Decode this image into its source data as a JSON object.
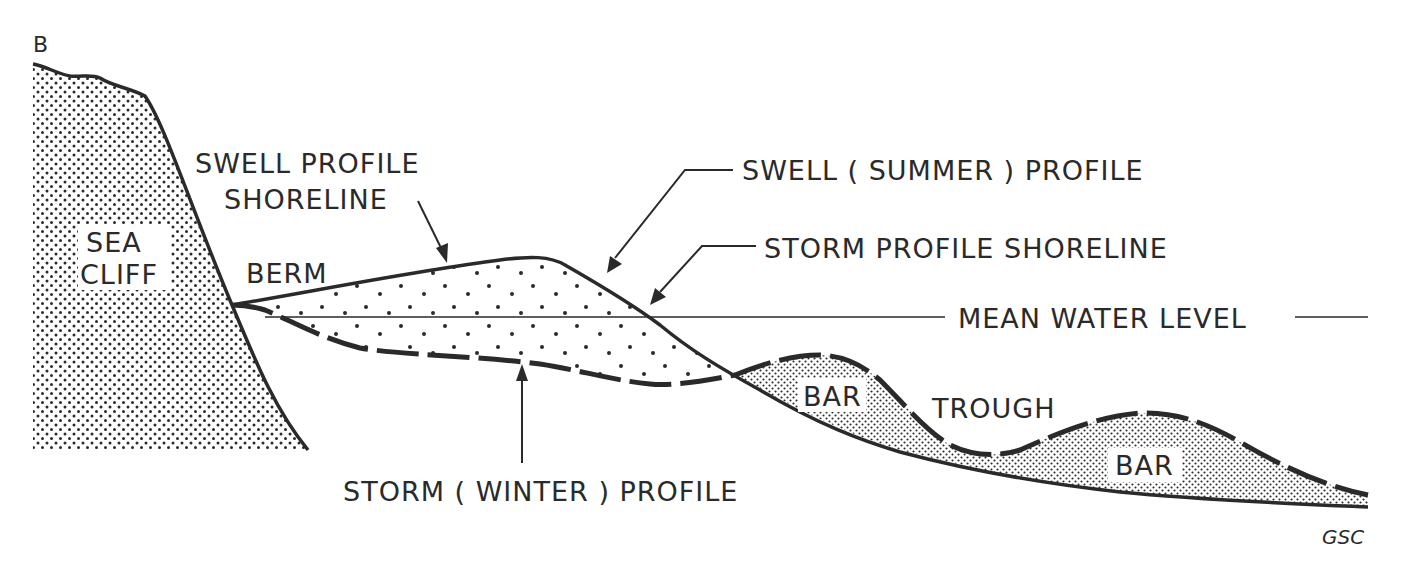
{
  "diagram": {
    "section_marker": "B",
    "credit": "GSC",
    "colors": {
      "ink": "#2a2a2a",
      "background": "#ffffff"
    },
    "labels": {
      "sea_cliff_line1": "SEA",
      "sea_cliff_line2": "CLIFF",
      "berm": "BERM",
      "swell_profile_shoreline_line1": "SWELL PROFILE",
      "swell_profile_shoreline_line2": "SHORELINE",
      "swell_summer_profile": "SWELL ( SUMMER ) PROFILE",
      "storm_profile_shoreline": "STORM PROFILE SHORELINE",
      "mean_water_level": "MEAN WATER LEVEL",
      "storm_winter_profile": "STORM ( WINTER ) PROFILE",
      "bar_1": "BAR",
      "trough": "TROUGH",
      "bar_2": "BAR"
    },
    "legend_lines": {
      "swell_profile": "solid line",
      "storm_profile": "dashed line",
      "mean_water_level": "thin horizontal line"
    }
  }
}
